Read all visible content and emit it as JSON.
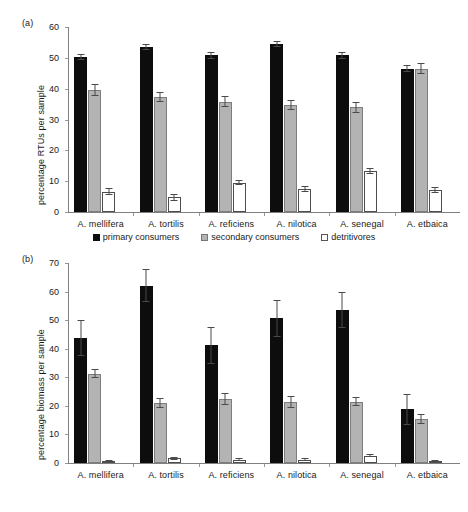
{
  "figure": {
    "legend": [
      {
        "key": "primary",
        "label": "primary consumers",
        "color": "#0d0d0d"
      },
      {
        "key": "secondary",
        "label": "secondary consumers",
        "color": "#b3b3b3"
      },
      {
        "key": "detritivore",
        "label": "detritivores",
        "color": "#ffffff"
      }
    ]
  },
  "panel_a": {
    "tag": "(a)",
    "ylabel": "percentage RTUs per sample",
    "yticks": [
      "0",
      "10",
      "20",
      "30",
      "40",
      "50",
      "60"
    ]
  },
  "panel_b": {
    "tag": "(b)",
    "ylabel": "percentage biomass per sample",
    "yticks": [
      "0",
      "10",
      "20",
      "30",
      "40",
      "50",
      "60",
      "70"
    ]
  },
  "chart_data": [
    {
      "type": "bar",
      "panel": "(a)",
      "title": "",
      "xlabel": "",
      "ylabel": "percentage RTUs per sample",
      "ylim": [
        0,
        60
      ],
      "yticks": [
        0,
        10,
        20,
        30,
        40,
        50,
        60
      ],
      "grid": false,
      "legend_position": "below-plot-center",
      "categories": [
        "A. mellifera",
        "A. tortilis",
        "A. reficiens",
        "A. nilotica",
        "A. senegal",
        "A. etbaica"
      ],
      "series": [
        {
          "name": "primary consumers",
          "color": "#0d0d0d",
          "values": [
            50.3,
            53.6,
            50.8,
            54.5,
            50.8,
            46.5
          ],
          "errors": [
            1.0,
            0.9,
            1.1,
            1.0,
            1.1,
            1.1
          ]
        },
        {
          "name": "secondary consumers",
          "color": "#b3b3b3",
          "values": [
            39.5,
            37.2,
            35.8,
            34.8,
            34.0,
            46.5
          ],
          "errors": [
            2.0,
            1.6,
            1.9,
            1.6,
            1.8,
            1.8
          ]
        },
        {
          "name": "detritivores",
          "color": "#ffffff",
          "values": [
            6.6,
            4.8,
            9.5,
            7.5,
            13.2,
            7.1
          ],
          "errors": [
            1.2,
            1.2,
            0.9,
            1.0,
            1.0,
            1.0
          ]
        }
      ]
    },
    {
      "type": "bar",
      "panel": "(b)",
      "title": "",
      "xlabel": "",
      "ylabel": "percentage biomass per sample",
      "ylim": [
        0,
        70
      ],
      "yticks": [
        0,
        10,
        20,
        30,
        40,
        50,
        60,
        70
      ],
      "grid": false,
      "legend_position": "above-plot-center",
      "categories": [
        "A. mellifera",
        "A. tortilis",
        "A. reficiens",
        "A. nilotica",
        "A. senegal",
        "A. etbaica"
      ],
      "series": [
        {
          "name": "primary consumers",
          "color": "#0d0d0d",
          "values": [
            43.8,
            62.0,
            41.2,
            50.6,
            53.5,
            18.8
          ],
          "errors": [
            6.2,
            5.8,
            6.5,
            6.5,
            6.3,
            5.5
          ]
        },
        {
          "name": "secondary consumers",
          "color": "#b3b3b3",
          "values": [
            31.2,
            21.0,
            22.4,
            21.4,
            21.5,
            15.4
          ],
          "errors": [
            1.6,
            1.8,
            2.2,
            2.0,
            1.6,
            1.6
          ]
        },
        {
          "name": "detritivores",
          "color": "#ffffff",
          "values": [
            0.6,
            1.6,
            1.2,
            1.2,
            2.6,
            0.6
          ],
          "errors": [
            0.4,
            0.4,
            0.4,
            0.4,
            0.6,
            0.3
          ]
        }
      ]
    }
  ]
}
